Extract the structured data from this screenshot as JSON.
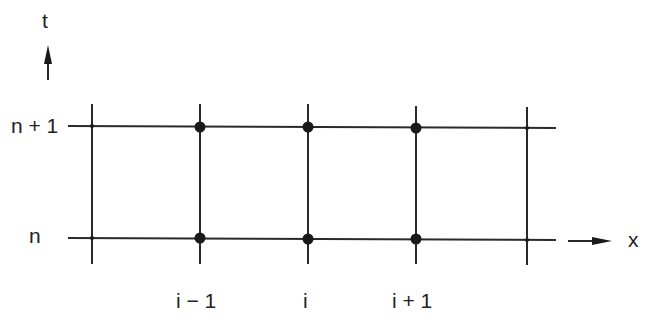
{
  "diagram": {
    "type": "finite-difference-stencil-grid",
    "axes": {
      "time_axis_label": "t",
      "space_axis_label": "x"
    },
    "row_labels": [
      "n + 1",
      "n"
    ],
    "column_labels": [
      "i − 1",
      "i",
      "i + 1"
    ],
    "grid": {
      "vertical_lines_x": [
        92,
        200,
        308,
        416,
        527
      ],
      "horizontal_lines_y": [
        127,
        238
      ],
      "nodes_highlighted": [
        {
          "col": "i − 1",
          "row": "n + 1"
        },
        {
          "col": "i",
          "row": "n + 1"
        },
        {
          "col": "i + 1",
          "row": "n + 1"
        },
        {
          "col": "i − 1",
          "row": "n"
        },
        {
          "col": "i",
          "row": "n"
        },
        {
          "col": "i + 1",
          "row": "n"
        }
      ]
    },
    "colors": {
      "line": "#2a2a2a",
      "node": "#1a1a1a",
      "background": "#ffffff"
    }
  }
}
